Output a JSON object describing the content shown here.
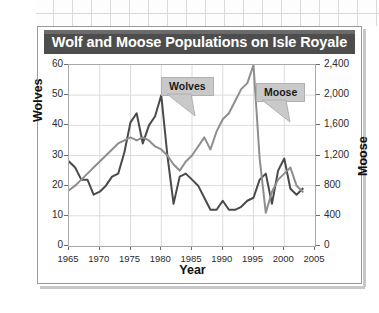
{
  "card": {
    "title": "Wolf and Moose Populations on Isle Royale"
  },
  "chart_data": {
    "type": "line",
    "title": "Wolf and Moose Populations on Isle Royale",
    "xlabel": "Year",
    "ylabel": "Wolves",
    "ylabel_right": "Moose",
    "grid": true,
    "legend_position": "inline-callouts",
    "xlim": [
      1965,
      2005
    ],
    "xticks": [
      "1965",
      "1970",
      "1975",
      "1980",
      "1985",
      "1990",
      "1995",
      "2000",
      "2005"
    ],
    "ylim": [
      0,
      60
    ],
    "yticks": [
      "0",
      "10",
      "20",
      "30",
      "40",
      "50",
      "60"
    ],
    "ylim_right": [
      0,
      2400
    ],
    "yticks_right": [
      "0",
      "400",
      "800",
      "1,200",
      "1,600",
      "2,000",
      "2,400"
    ],
    "colors": {
      "wolves": "#4a4a4a",
      "moose": "#8e8e8e",
      "grid": "#dcdcdc",
      "frame": "#a8a8a8",
      "title_bar": "#4d4d4d",
      "callout_fill": "#c9c9c9"
    },
    "series": [
      {
        "name": "Wolves",
        "axis": "left",
        "units": "wolves",
        "x": [
          1965,
          1966,
          1967,
          1968,
          1969,
          1970,
          1971,
          1972,
          1973,
          1974,
          1975,
          1976,
          1977,
          1978,
          1979,
          1980,
          1981,
          1982,
          1983,
          1984,
          1985,
          1986,
          1987,
          1988,
          1989,
          1990,
          1991,
          1992,
          1993,
          1994,
          1995,
          1996,
          1997,
          1998,
          1999,
          2000,
          2001,
          2002,
          2003
        ],
        "values": [
          28,
          26,
          22,
          22,
          17,
          18,
          20,
          23,
          24,
          31,
          41,
          44,
          34,
          40,
          43,
          50,
          30,
          14,
          23,
          24,
          22,
          20,
          16,
          12,
          12,
          15,
          12,
          12,
          13,
          15,
          16,
          22,
          24,
          14,
          25,
          29,
          19,
          17,
          19
        ]
      },
      {
        "name": "Moose",
        "axis": "right",
        "units": "moose",
        "x": [
          1965,
          1966,
          1967,
          1968,
          1969,
          1970,
          1971,
          1972,
          1973,
          1974,
          1975,
          1976,
          1977,
          1978,
          1979,
          1980,
          1981,
          1982,
          1983,
          1984,
          1985,
          1986,
          1987,
          1988,
          1989,
          1990,
          1991,
          1992,
          1993,
          1994,
          1995,
          1996,
          1997,
          1998,
          1999,
          2000,
          2001,
          2002,
          2003
        ],
        "values": [
          740,
          800,
          880,
          960,
          1040,
          1120,
          1200,
          1280,
          1360,
          1400,
          1440,
          1400,
          1440,
          1400,
          1320,
          1280,
          1200,
          1080,
          1000,
          1120,
          1200,
          1320,
          1440,
          1280,
          1520,
          1680,
          1760,
          1920,
          2080,
          2160,
          2400,
          1160,
          440,
          720,
          880,
          960,
          1040,
          800,
          720
        ]
      }
    ],
    "annotations": [
      {
        "label": "Wolves",
        "target_series": "Wolves",
        "at_x": 1980
      },
      {
        "label": "Moose",
        "target_series": "Moose",
        "at_x": 1995
      }
    ]
  }
}
